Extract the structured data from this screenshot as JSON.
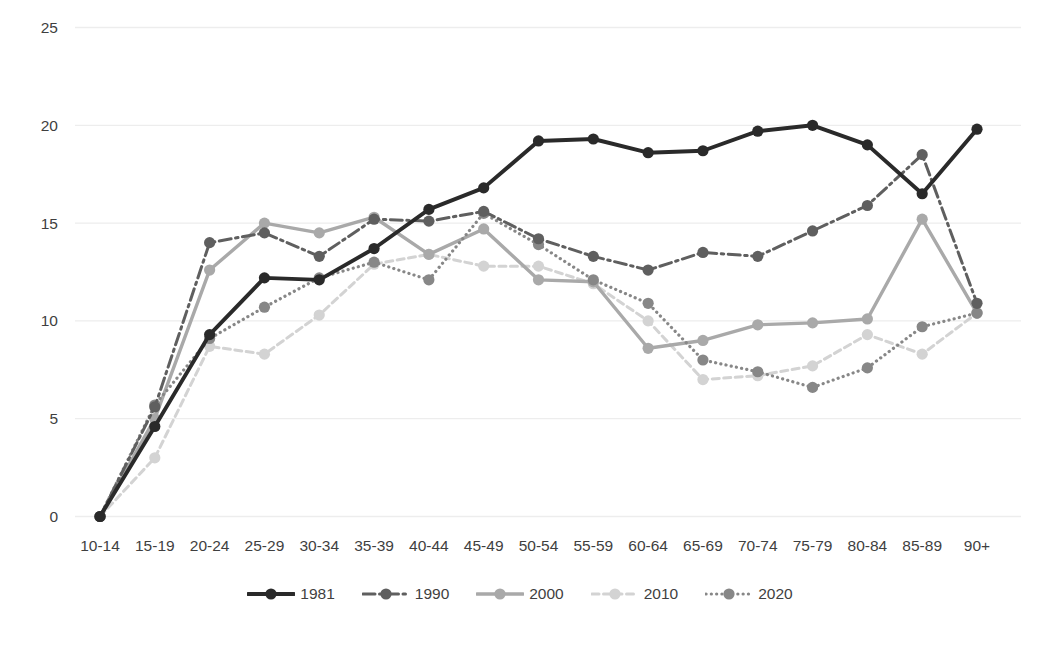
{
  "chart_data": {
    "type": "line",
    "title": "",
    "xlabel": "",
    "ylabel": "",
    "categories": [
      "10-14",
      "15-19",
      "20-24",
      "25-29",
      "30-34",
      "35-39",
      "40-44",
      "45-49",
      "50-54",
      "55-59",
      "60-64",
      "65-69",
      "70-74",
      "75-79",
      "80-84",
      "85-89",
      "90+"
    ],
    "series": [
      {
        "name": "1981",
        "color": "#2a2a2a",
        "line_style": "solid",
        "values": [
          0,
          4.6,
          9.3,
          12.2,
          12.1,
          13.7,
          15.7,
          16.8,
          19.2,
          19.3,
          18.6,
          18.7,
          19.7,
          20.0,
          19.0,
          16.5,
          19.8
        ]
      },
      {
        "name": "1990",
        "color": "#5f5f5f",
        "line_style": "dash-dot",
        "values": [
          0,
          5.6,
          14.0,
          14.5,
          13.3,
          15.2,
          15.1,
          15.6,
          14.2,
          13.3,
          12.6,
          13.5,
          13.3,
          14.6,
          15.9,
          18.5,
          10.9
        ]
      },
      {
        "name": "2000",
        "color": "#a9a9a9",
        "line_style": "solid",
        "values": [
          0,
          5.0,
          12.6,
          15.0,
          14.5,
          15.3,
          13.4,
          14.7,
          12.1,
          12.0,
          8.6,
          9.0,
          9.8,
          9.9,
          10.1,
          15.2,
          10.4
        ]
      },
      {
        "name": "2010",
        "color": "#d3d3d3",
        "line_style": "dash",
        "values": [
          0,
          3.0,
          8.7,
          8.3,
          10.3,
          12.9,
          13.4,
          12.8,
          12.8,
          11.9,
          10.0,
          7.0,
          7.2,
          7.7,
          9.3,
          8.3,
          10.4
        ]
      },
      {
        "name": "2020",
        "color": "#878787",
        "line_style": "dot",
        "values": [
          0,
          5.7,
          9.1,
          10.7,
          12.2,
          13.0,
          12.1,
          15.5,
          13.9,
          12.1,
          10.9,
          8.0,
          7.4,
          6.6,
          7.6,
          9.7,
          10.4
        ]
      }
    ],
    "y_axis": {
      "min": 0,
      "max": 25,
      "step": 5,
      "tick_labels": [
        "0",
        "5",
        "10",
        "15",
        "20",
        "25"
      ]
    },
    "x_axis": {
      "tick_labels": [
        "10-14",
        "15-19",
        "20-24",
        "25-29",
        "30-34",
        "35-39",
        "40-44",
        "45-49",
        "50-54",
        "55-59",
        "60-64",
        "65-69",
        "70-74",
        "75-79",
        "80-84",
        "85-89",
        "90+"
      ]
    },
    "legend": {
      "position": "bottom",
      "entries": [
        "1981",
        "1990",
        "2000",
        "2010",
        "2020"
      ]
    },
    "grid": true
  },
  "colors": {
    "background": "#ffffff",
    "text": "#3f3f3f",
    "gridline": "#ededed"
  }
}
